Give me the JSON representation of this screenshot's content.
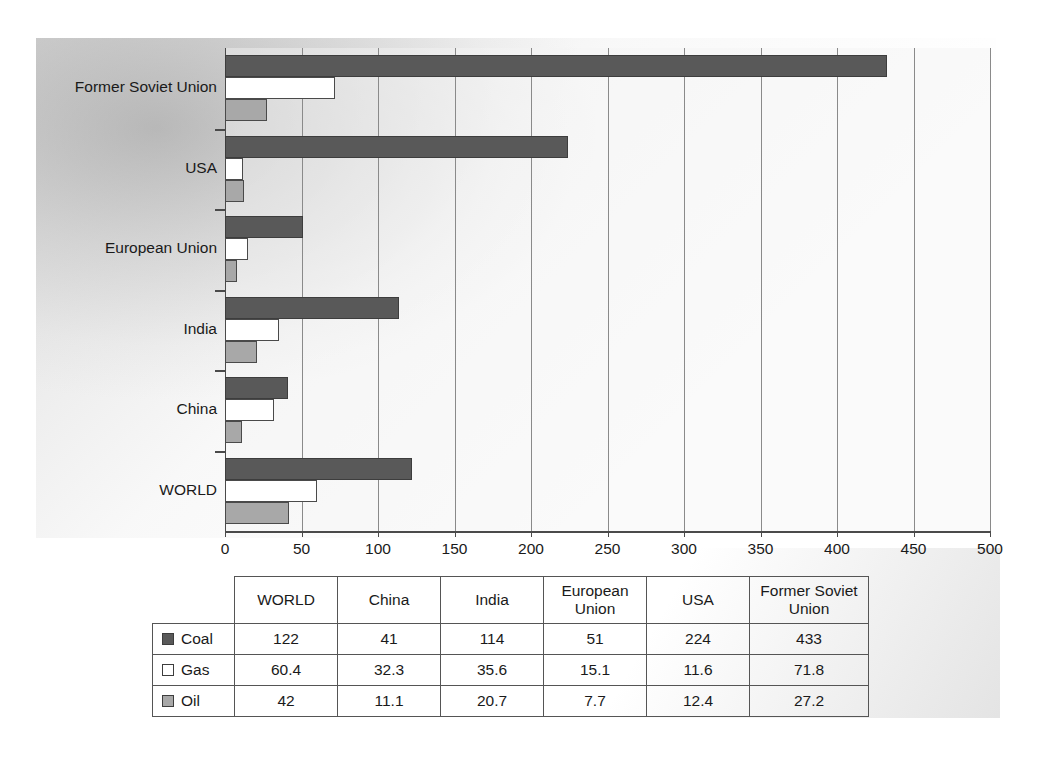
{
  "chart_data": {
    "type": "bar",
    "orientation": "horizontal",
    "title": "",
    "xlabel": "",
    "ylabel": "",
    "xlim": [
      0,
      500
    ],
    "xticks": [
      0,
      50,
      100,
      150,
      200,
      250,
      300,
      350,
      400,
      450,
      500
    ],
    "grid": true,
    "legend_position": "table-left",
    "categories": [
      "WORLD",
      "China",
      "India",
      "European Union",
      "USA",
      "Former Soviet Union"
    ],
    "categories_top_to_bottom": [
      "Former Soviet Union",
      "USA",
      "European Union",
      "India",
      "China",
      "WORLD"
    ],
    "series": [
      {
        "name": "Coal",
        "color": "#595959",
        "values": [
          122,
          41,
          114,
          51,
          224,
          433
        ]
      },
      {
        "name": "Gas",
        "color": "#ffffff",
        "values": [
          60.4,
          32.3,
          35.6,
          15.1,
          11.6,
          71.8
        ]
      },
      {
        "name": "Oil",
        "color": "#a8a8a8",
        "values": [
          42,
          11.1,
          20.7,
          7.7,
          12.4,
          27.2
        ]
      }
    ]
  },
  "axis": {
    "x_tick_labels": [
      "0",
      "50",
      "100",
      "150",
      "200",
      "250",
      "300",
      "350",
      "400",
      "450",
      "500"
    ],
    "y_tick_labels": [
      "Former Soviet Union",
      "USA",
      "European Union",
      "India",
      "China",
      "WORLD"
    ]
  },
  "table": {
    "corner": "",
    "headers": [
      "WORLD",
      "China",
      "India",
      "European Union",
      "USA",
      "Former Soviet Union"
    ],
    "rows": [
      {
        "legend": "Coal",
        "swatch": "coal-swatch",
        "values": [
          "122",
          "41",
          "114",
          "51",
          "224",
          "433"
        ]
      },
      {
        "legend": "Gas",
        "swatch": "gas-swatch",
        "values": [
          "60.4",
          "32.3",
          "35.6",
          "15.1",
          "11.6",
          "71.8"
        ]
      },
      {
        "legend": "Oil",
        "swatch": "oil-swatch",
        "values": [
          "42",
          "11.1",
          "20.7",
          "7.7",
          "12.4",
          "27.2"
        ]
      }
    ]
  },
  "colors": {
    "coal": "#595959",
    "gas": "#ffffff",
    "oil": "#a8a8a8",
    "axis": "#4a4a4a",
    "grid": "#8a8a8a"
  }
}
